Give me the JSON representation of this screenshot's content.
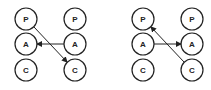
{
  "diagrams": [
    {
      "nodes": [
        {
          "label": "P",
          "x": 26,
          "y": 19
        },
        {
          "label": "A",
          "x": 26,
          "y": 44
        },
        {
          "label": "C",
          "x": 26,
          "y": 70
        },
        {
          "label": "P",
          "x": 75,
          "y": 19
        },
        {
          "label": "A",
          "x": 75,
          "y": 44
        },
        {
          "label": "C",
          "x": 75,
          "y": 70
        }
      ],
      "edges": [
        {
          "from": "A (right)",
          "to": "A (left)",
          "x1": 64,
          "y1": 44,
          "x2": 37,
          "y2": 44
        },
        {
          "from": "P (left)",
          "to": "C (right)",
          "x1": 34,
          "y1": 27,
          "x2": 67,
          "y2": 62
        }
      ]
    },
    {
      "nodes": [
        {
          "label": "P",
          "x": 143,
          "y": 19
        },
        {
          "label": "A",
          "x": 143,
          "y": 44
        },
        {
          "label": "C",
          "x": 143,
          "y": 70
        },
        {
          "label": "P",
          "x": 192,
          "y": 19
        },
        {
          "label": "A",
          "x": 192,
          "y": 44
        },
        {
          "label": "C",
          "x": 192,
          "y": 70
        }
      ],
      "edges": [
        {
          "from": "A (left)",
          "to": "A (right)",
          "x1": 154,
          "y1": 44,
          "x2": 181,
          "y2": 44
        },
        {
          "from": "C (right)",
          "to": "P (left)",
          "x1": 184,
          "y1": 62,
          "x2": 151,
          "y2": 27
        }
      ]
    }
  ]
}
